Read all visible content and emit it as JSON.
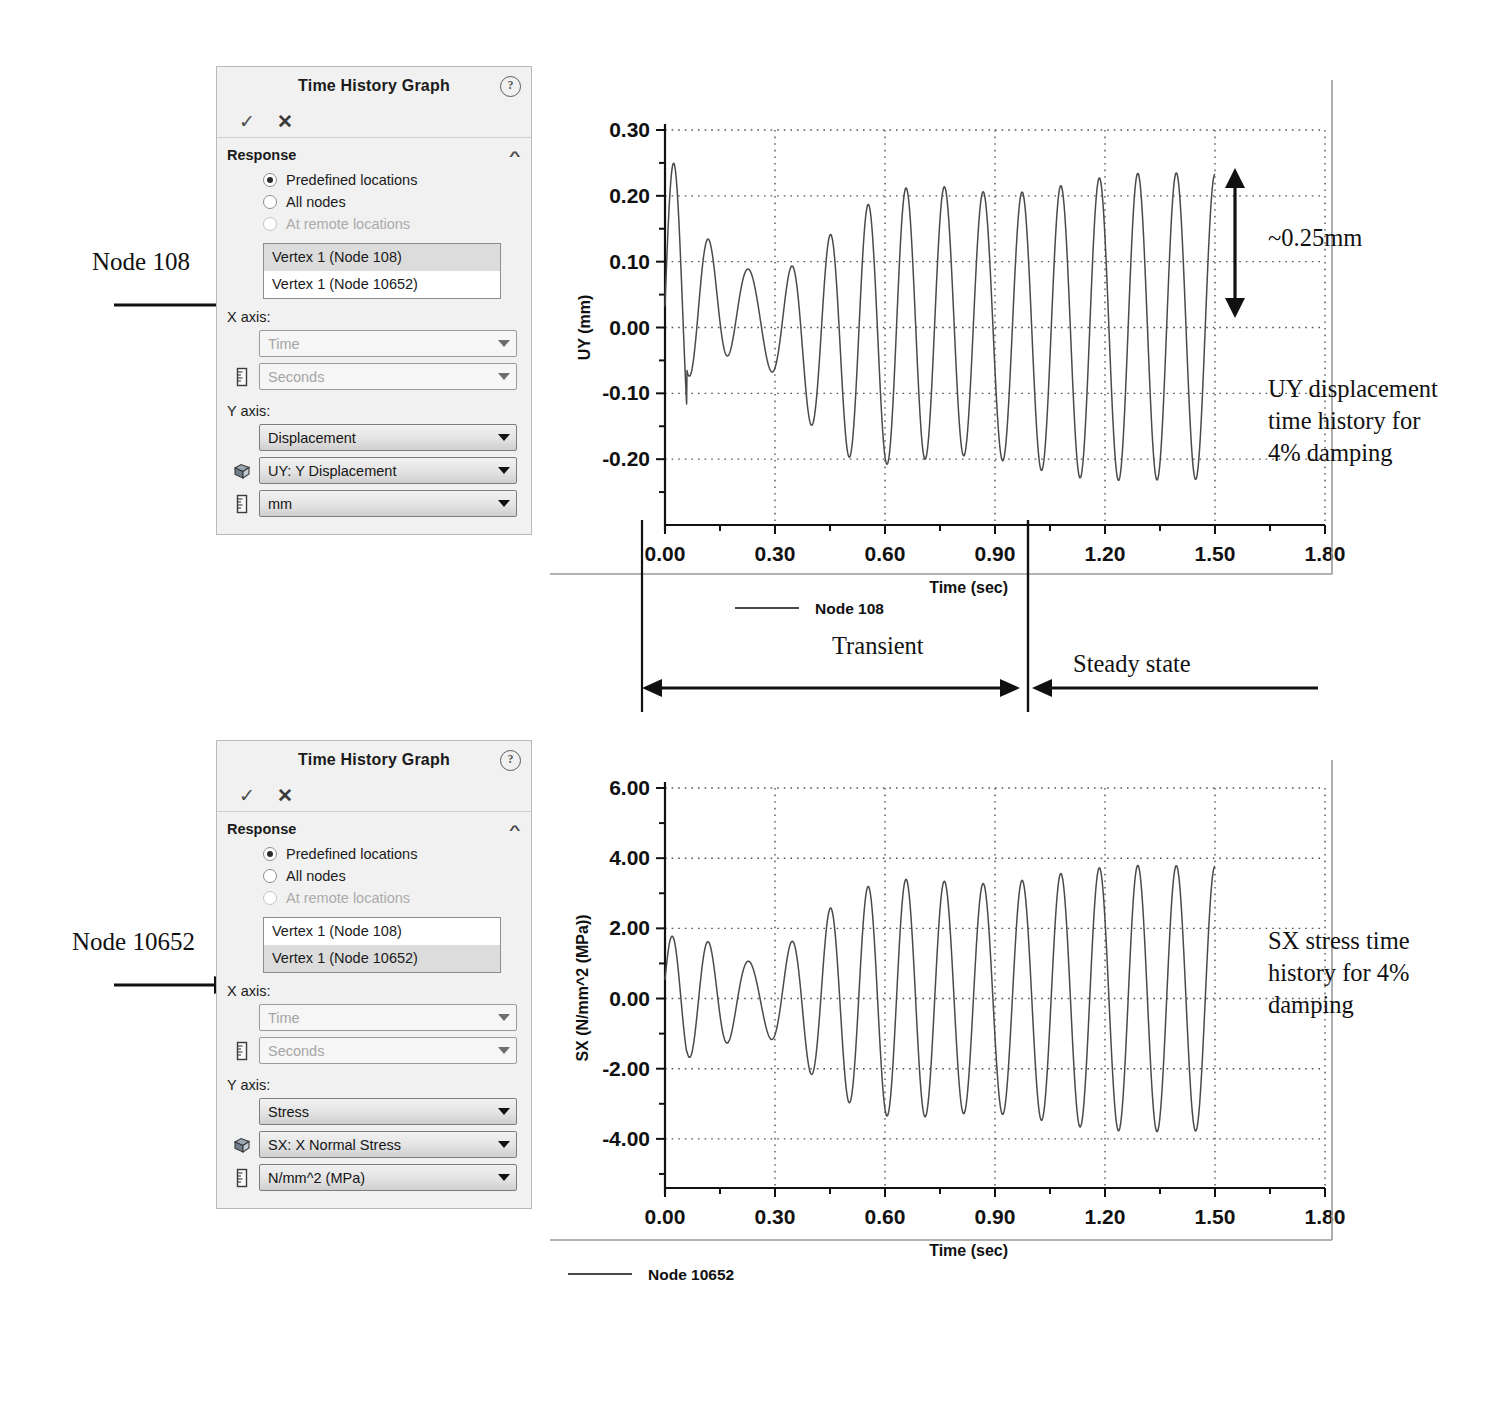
{
  "panels": [
    {
      "title": "Time History Graph",
      "help_icon": "help-icon",
      "ok_label": "✓",
      "cancel_label": "✕",
      "section_title": "Response",
      "collapse_icon": "chevron-up-icon",
      "radios": [
        {
          "label": "Predefined locations",
          "selected": true,
          "disabled": false
        },
        {
          "label": "All nodes",
          "selected": false,
          "disabled": false
        },
        {
          "label": "At remote locations",
          "selected": false,
          "disabled": true
        }
      ],
      "list": [
        {
          "label": "Vertex 1 (Node 108)",
          "selected": true
        },
        {
          "label": "Vertex 1 (Node 10652)",
          "selected": false
        }
      ],
      "x_axis_label": "X axis:",
      "y_axis_label": "Y axis:",
      "x_quantity": {
        "value": "Time",
        "active": false,
        "icon": "none"
      },
      "x_unit": {
        "value": "Seconds",
        "active": false,
        "icon": "ruler-icon"
      },
      "y_quantity": {
        "value": "Displacement",
        "active": true,
        "icon": "none"
      },
      "y_component": {
        "value": "UY: Y Displacement",
        "active": true,
        "icon": "cube-icon"
      },
      "y_unit": {
        "value": "mm",
        "active": true,
        "icon": "ruler-icon"
      }
    },
    {
      "title": "Time History Graph",
      "help_icon": "help-icon",
      "ok_label": "✓",
      "cancel_label": "✕",
      "section_title": "Response",
      "collapse_icon": "chevron-up-icon",
      "radios": [
        {
          "label": "Predefined locations",
          "selected": true,
          "disabled": false
        },
        {
          "label": "All nodes",
          "selected": false,
          "disabled": false
        },
        {
          "label": "At remote locations",
          "selected": false,
          "disabled": true
        }
      ],
      "list": [
        {
          "label": "Vertex 1 (Node 108)",
          "selected": false
        },
        {
          "label": "Vertex 1 (Node 10652)",
          "selected": true
        }
      ],
      "x_axis_label": "X axis:",
      "y_axis_label": "Y axis:",
      "x_quantity": {
        "value": "Time",
        "active": false,
        "icon": "none"
      },
      "x_unit": {
        "value": "Seconds",
        "active": false,
        "icon": "ruler-icon"
      },
      "y_quantity": {
        "value": "Stress",
        "active": true,
        "icon": "none"
      },
      "y_component": {
        "value": "SX: X Normal Stress",
        "active": true,
        "icon": "cube-icon"
      },
      "y_unit": {
        "value": "N/mm^2 (MPa)",
        "active": true,
        "icon": "ruler-icon"
      }
    }
  ],
  "callouts": {
    "node_108": "Node 108",
    "node_10652": "Node 10652",
    "amplitude": "~0.25mm",
    "uy_note": "UY displacement\ntime history for\n4% damping",
    "sx_note": "SX stress time\nhistory for 4%\ndamping",
    "transient": "Transient",
    "steady_state": "Steady state"
  },
  "chart_data": [
    {
      "id": "uy-chart",
      "type": "line",
      "title": "",
      "xlabel": "Time (sec)",
      "ylabel": "UY (mm)",
      "xlim": [
        0.0,
        1.8
      ],
      "ylim": [
        -0.3,
        0.3
      ],
      "xticks": [
        0.0,
        0.3,
        0.6,
        0.9,
        1.2,
        1.5,
        1.8
      ],
      "xticklabels": [
        "0.00",
        "0.30",
        "0.60",
        "0.90",
        "1.20",
        "1.50",
        "1.80"
      ],
      "xminor_step": 0.15,
      "yticks": [
        -0.2,
        -0.1,
        0.0,
        0.1,
        0.2,
        0.3
      ],
      "yticklabels": [
        "-0.20",
        "-0.10",
        "0.00",
        "0.10",
        "0.20",
        "0.30"
      ],
      "yminor_step": 0.05,
      "grid": "dotted",
      "legend": [
        {
          "name": "Node 108",
          "color": "#4a4a4a"
        }
      ],
      "legend_position": "bottom-center",
      "data_end_time": 1.5,
      "signal": {
        "model": "damped-driven-beat",
        "drive_freq_hz": 9.5,
        "beat_freq_hz": 1.6,
        "damping_ratio": 0.04,
        "steady_amplitude_mm": 0.24,
        "transient_peak_mm": 0.3,
        "transient_peak_time_s": 0.3,
        "start_amplitude_mm": 0.07,
        "transient_end_s": 1.02,
        "samples": 1400
      }
    },
    {
      "id": "sx-chart",
      "type": "line",
      "title": "",
      "xlabel": "Time (sec)",
      "ylabel": "SX (N/mm^2 (MPa))",
      "xlim": [
        0.0,
        1.8
      ],
      "ylim": [
        -5.4,
        6.0
      ],
      "xticks": [
        0.0,
        0.3,
        0.6,
        0.9,
        1.2,
        1.5,
        1.8
      ],
      "xticklabels": [
        "0.00",
        "0.30",
        "0.60",
        "0.90",
        "1.20",
        "1.50",
        "1.80"
      ],
      "xminor_step": 0.15,
      "yticks": [
        -4.0,
        -2.0,
        0.0,
        2.0,
        4.0,
        6.0
      ],
      "yticklabels": [
        "-4.00",
        "-2.00",
        "0.00",
        "2.00",
        "4.00",
        "6.00"
      ],
      "yminor_step": 1.0,
      "grid": "dotted",
      "legend": [
        {
          "name": "Node 10652",
          "color": "#4a4a4a"
        }
      ],
      "legend_position": "bottom-center",
      "data_end_time": 1.5,
      "signal": {
        "model": "damped-driven-beat",
        "drive_freq_hz": 9.5,
        "beat_freq_hz": 1.6,
        "damping_ratio": 0.04,
        "steady_amplitude_mpa": 3.9,
        "transient_peak_mpa": 4.9,
        "transient_peak_time_s": 0.3,
        "start_amplitude_mpa": 1.15,
        "transient_end_s": 1.02,
        "samples": 1400
      }
    }
  ]
}
